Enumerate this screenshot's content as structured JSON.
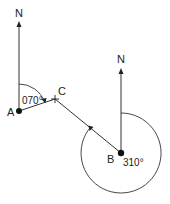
{
  "diagram": {
    "type": "bearings",
    "colors": {
      "line": "#333333",
      "text": "#222222",
      "background": "#ffffff"
    },
    "points": {
      "A": {
        "label": "A",
        "x": 19,
        "y": 111
      },
      "B": {
        "label": "B",
        "x": 121,
        "y": 153
      },
      "C": {
        "label": "C",
        "x": 55,
        "y": 99
      }
    },
    "north_labels": {
      "at_A": "N",
      "at_B": "N"
    },
    "angles": {
      "at_A": {
        "value": "070°",
        "from": "North",
        "to": "AC"
      },
      "at_B": {
        "value": "310°",
        "from": "North",
        "to": "BC",
        "direction": "clockwise"
      }
    }
  }
}
